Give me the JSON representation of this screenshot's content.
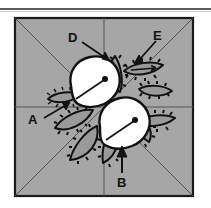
{
  "figure": {
    "background_color": "#a6a6a6",
    "block": {
      "fill": "#a6a6a6",
      "border_color": "#1a1a1a",
      "x": 15,
      "y": 18,
      "size": 178,
      "grid_lines": [
        "diagonal-top-left-to-bottom-right",
        "diagonal-top-right-to-bottom-left",
        "horizontal-center",
        "vertical-center"
      ],
      "grid_color": "#555555"
    },
    "top_rule_color": "#5a5a5a",
    "flowers": [
      {
        "name": "upper-flower",
        "fill": "#ffffff",
        "outline": "#111111",
        "has_stamen_dot": true,
        "has_stem_line": true
      },
      {
        "name": "lower-flower",
        "fill": "#ffffff",
        "outline": "#111111",
        "has_stamen_dot": true,
        "has_stem_line": true
      }
    ],
    "leaves": {
      "count": 9,
      "fill": "#9a9a9a",
      "outline": "#111111",
      "edge_style": "blanket-stitch"
    },
    "labels": [
      {
        "id": "A",
        "text": "A",
        "x": 28,
        "y": 113,
        "arrow_from": [
          44,
          117
        ],
        "arrow_to": [
          69,
          103
        ],
        "target": "left-leaf-tip"
      },
      {
        "id": "B",
        "text": "B",
        "x": 117,
        "y": 176,
        "arrow_from": [
          122,
          174
        ],
        "arrow_to": [
          122,
          148
        ],
        "target": "lower-flower-base"
      },
      {
        "id": "D",
        "text": "D",
        "x": 68,
        "y": 31,
        "arrow_from": [
          81,
          42
        ],
        "arrow_to": [
          107,
          60
        ],
        "target": "upper-leaf-cluster"
      },
      {
        "id": "E",
        "text": "E",
        "x": 153,
        "y": 29,
        "arrow_from": [
          155,
          41
        ],
        "arrow_to": [
          136,
          62
        ],
        "target": "right-leaf-vein"
      }
    ],
    "arrow_color": "#111111"
  }
}
